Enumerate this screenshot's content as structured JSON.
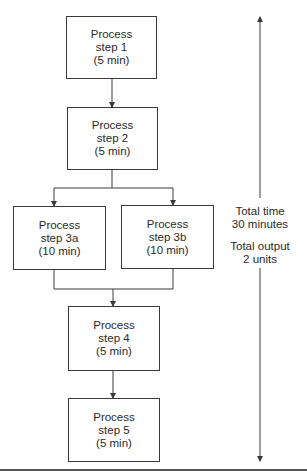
{
  "diagram": {
    "type": "process-flow",
    "steps": [
      {
        "id": "step1",
        "lines": [
          "Process",
          "step 1",
          "(5 min)"
        ],
        "duration_min": 5
      },
      {
        "id": "step2",
        "lines": [
          "Process",
          "step 2",
          "(5 min)"
        ],
        "duration_min": 5
      },
      {
        "id": "step3a",
        "lines": [
          "Process",
          "step 3a",
          "(10 min)"
        ],
        "duration_min": 10
      },
      {
        "id": "step3b",
        "lines": [
          "Process",
          "step 3b",
          "(10 min)"
        ],
        "duration_min": 10
      },
      {
        "id": "step4",
        "lines": [
          "Process",
          "step 4",
          "(5 min)"
        ],
        "duration_min": 5
      },
      {
        "id": "step5",
        "lines": [
          "Process",
          "step 5",
          "(5 min)"
        ],
        "duration_min": 5
      }
    ],
    "edges": [
      [
        "step1",
        "step2"
      ],
      [
        "step2",
        "step3a"
      ],
      [
        "step2",
        "step3b"
      ],
      [
        "step3a",
        "step4"
      ],
      [
        "step3b",
        "step4"
      ],
      [
        "step4",
        "step5"
      ]
    ],
    "summary": {
      "time_line1": "Total time",
      "time_line2": "30 minutes",
      "output_line1": "Total output",
      "output_line2": "2 units"
    },
    "colors": {
      "line": "#3a3a3a",
      "text": "#2a2a2a",
      "background": "#ffffff"
    }
  }
}
